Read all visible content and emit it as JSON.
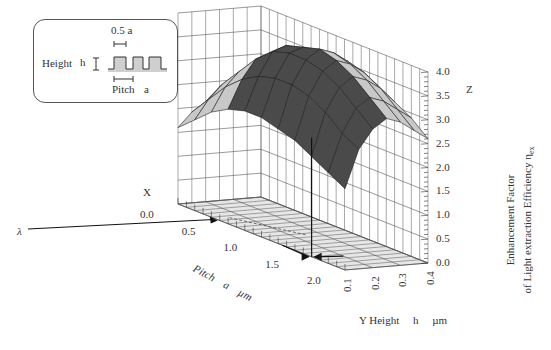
{
  "chart_data": {
    "type": "surface3d",
    "title": "",
    "x_axis": {
      "label": "Pitch",
      "symbol": "a",
      "unit": "µm",
      "ticks": [
        "0.0",
        "0.5",
        "1.0",
        "1.5",
        "2.0"
      ],
      "range": [
        0.0,
        2.0
      ],
      "corner_label": "X"
    },
    "y_axis": {
      "label": "Y Height",
      "symbol": "h",
      "unit": "µm",
      "ticks": [
        "0.1",
        "0.2",
        "0.3",
        "0.4"
      ],
      "range": [
        0.1,
        0.4
      ]
    },
    "z_axis": {
      "label_line1": "Enhancement Factor",
      "label_line2": "of Light extraction Efficiency η",
      "subscript": "ex",
      "ticks": [
        "0.0",
        "0.5",
        "1.0",
        "1.5",
        "2.0",
        "2.5",
        "3.0",
        "3.5",
        "4.0"
      ],
      "range": [
        0.0,
        4.0
      ],
      "corner_label": "Z"
    },
    "annotation": {
      "lambda_label": "λ",
      "lambda_pitch": 0.5
    },
    "peak_marker": {
      "pitch": 1.6,
      "height": 0.18,
      "value": 2.5
    },
    "pitch_values": [
      0.0,
      0.2,
      0.4,
      0.6,
      0.8,
      1.0,
      1.2,
      1.4,
      1.6,
      1.8,
      2.0
    ],
    "height_values": [
      0.1,
      0.15,
      0.2,
      0.25,
      0.3,
      0.35,
      0.4
    ],
    "z_values": [
      [
        1.6,
        1.9,
        2.2,
        2.4,
        2.5,
        2.5,
        2.4,
        2.3,
        2.1,
        1.9,
        1.7
      ],
      [
        1.9,
        2.3,
        2.7,
        3.0,
        3.2,
        3.3,
        3.3,
        3.2,
        3.0,
        2.7,
        2.5
      ],
      [
        2.1,
        2.6,
        3.0,
        3.4,
        3.7,
        3.8,
        3.8,
        3.7,
        3.5,
        3.2,
        2.9
      ],
      [
        2.2,
        2.7,
        3.1,
        3.5,
        3.8,
        3.9,
        4.0,
        3.9,
        3.7,
        3.4,
        3.1
      ],
      [
        2.1,
        2.6,
        3.0,
        3.4,
        3.7,
        3.8,
        3.9,
        3.8,
        3.6,
        3.3,
        3.0
      ],
      [
        2.0,
        2.4,
        2.8,
        3.2,
        3.5,
        3.6,
        3.7,
        3.6,
        3.4,
        3.1,
        2.8
      ],
      [
        1.9,
        2.2,
        2.6,
        3.0,
        3.2,
        3.4,
        3.4,
        3.3,
        3.1,
        2.9,
        2.6
      ]
    ]
  },
  "inset": {
    "height_label": "Height",
    "height_symbol": "h",
    "width_label": "0.5 a",
    "pitch_label": "Pitch",
    "pitch_symbol": "a"
  },
  "labels": {
    "x_corner": "X",
    "z_corner": "Z",
    "lambda": "λ",
    "pitch_title": "Pitch",
    "pitch_symbol": "a",
    "pitch_unit": "µm",
    "height_title": "Y Height",
    "height_symbol": "h",
    "height_unit": "µm",
    "z_title_1": "Enhancement Factor",
    "z_title_2": "of Light extraction Efficiency η",
    "z_title_sub": "ex"
  },
  "colors": {
    "surface_top": "#4a4a4a",
    "surface_light": "#c8c8c8",
    "grid": "#555555",
    "floor": "#e6e6e6"
  }
}
